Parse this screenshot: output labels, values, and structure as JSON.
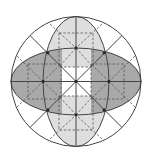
{
  "diagram": {
    "title": "",
    "colors": {
      "background": "#ffffff",
      "stroke": "#444444",
      "dashed_stroke": "#555555",
      "dark_fill": "#a9a9a9",
      "light_fill": "#dedede",
      "dot": "#222222"
    },
    "circle": {
      "cx": 76,
      "cy": 81.5,
      "r": 65
    },
    "ellipses": [
      {
        "name": "horizontal-ellipse",
        "cx": 76,
        "cy": 81.5,
        "rx": 65,
        "ry": 33.5
      },
      {
        "name": "vertical-ellipse",
        "cx": 76,
        "cy": 81.5,
        "rx": 33,
        "ry": 65
      }
    ],
    "dashed_squares": [
      {
        "name": "top",
        "x": 59,
        "y": 33,
        "w": 34,
        "h": 34
      },
      {
        "name": "bottom",
        "x": 59,
        "y": 96,
        "w": 34,
        "h": 34
      },
      {
        "name": "left",
        "x": 28,
        "y": 64,
        "w": 33,
        "h": 35
      },
      {
        "name": "right",
        "x": 91,
        "y": 64,
        "w": 33,
        "h": 35
      }
    ],
    "dots": [
      {
        "x": 76,
        "y": 81.5
      },
      {
        "x": 76,
        "y": 48
      },
      {
        "x": 76,
        "y": 115
      },
      {
        "x": 43,
        "y": 81.5
      },
      {
        "x": 109,
        "y": 81.5
      },
      {
        "x": 48,
        "y": 53
      },
      {
        "x": 104,
        "y": 53
      },
      {
        "x": 48,
        "y": 110
      },
      {
        "x": 104,
        "y": 110
      }
    ],
    "labels": []
  }
}
